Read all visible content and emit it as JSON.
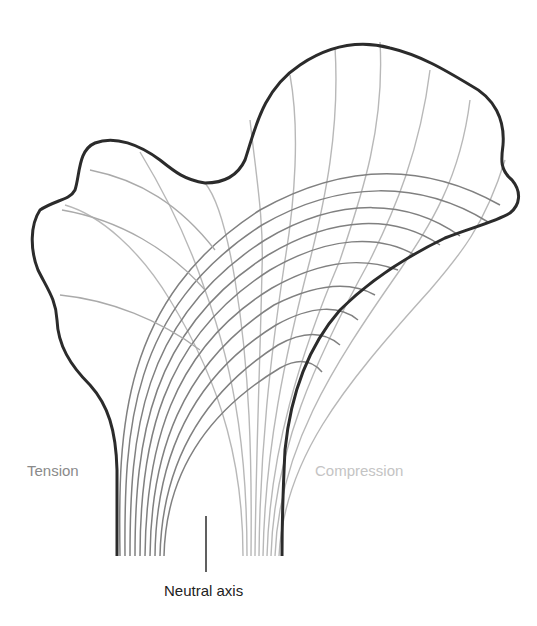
{
  "figure": {
    "labels": {
      "tension": "Tension",
      "compression": "Compression",
      "neutral_axis": "Neutral axis"
    },
    "colors": {
      "outline": "#2b2b2b",
      "tension_lines": "#7d7d7d",
      "compression_lines": "#b5b5b5",
      "tension_label": "#8a8a8a",
      "compression_label": "#c4c4c4",
      "neutral_label": "#222222"
    }
  }
}
